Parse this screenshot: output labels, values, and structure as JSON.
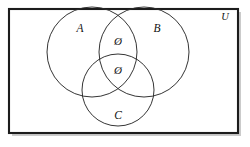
{
  "figure": {
    "kind": "venn-diagram",
    "background_color": "#ffffff",
    "stroke_color": "#2a2a2a",
    "frame_color": "#1c1c1c"
  },
  "universe": {
    "label": "U",
    "label_display": "U",
    "name": "universal-set"
  },
  "sets": [
    {
      "id": "A",
      "label": "A",
      "cx": 92,
      "cy": 52,
      "r": 45
    },
    {
      "id": "B",
      "label": "B",
      "cx": 144,
      "cy": 52,
      "r": 45
    },
    {
      "id": "C",
      "label": "C",
      "cx": 118,
      "cy": 90,
      "r": 36
    }
  ],
  "set_labels": {
    "a": "A",
    "b": "B",
    "c": "C"
  },
  "region_marks": [
    {
      "region": "A-and-B",
      "symbol": "Ø",
      "x": 118,
      "y": 42
    },
    {
      "region": "A-and-B-and-C",
      "symbol": "Ø",
      "x": 118,
      "y": 71
    }
  ],
  "marks": {
    "empty_set_top": "Ø",
    "empty_set_center": "Ø"
  }
}
